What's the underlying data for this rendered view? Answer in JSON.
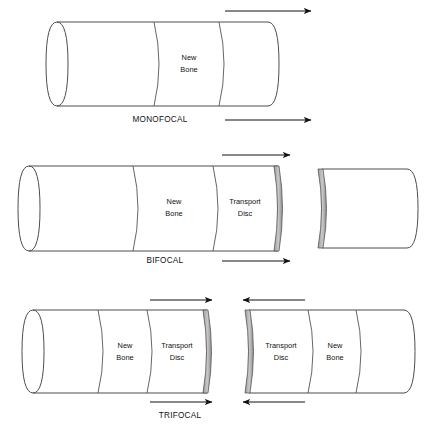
{
  "figure": {
    "title_visible": false,
    "background_color": "#ffffff",
    "outline_color": "#4d4d4d",
    "arrow_color": "#111111",
    "text_color": "#111111"
  },
  "labels": {
    "new_bone": "New\nBone",
    "new_bone_line1": "New",
    "new_bone_line2": "Bone",
    "transport_disc_line1": "Transport",
    "transport_disc_line2": "Disc"
  },
  "panels": [
    {
      "id": "monofocal",
      "caption": "MONOFOCAL",
      "segments": [
        {
          "name": "host-bone-proximal",
          "label": ""
        },
        {
          "name": "regenerate",
          "label_line1": "New",
          "label_line2": "Bone"
        },
        {
          "name": "host-bone-distal",
          "label": ""
        }
      ],
      "arrows": [
        {
          "name": "top-arrow",
          "direction": "right"
        },
        {
          "name": "bottom-arrow",
          "direction": "right"
        }
      ],
      "fragment_count": 1
    },
    {
      "id": "bifocal",
      "caption": "BIFOCAL",
      "segments": [
        {
          "name": "host-bone-proximal",
          "label": ""
        },
        {
          "name": "regenerate",
          "label_line1": "New",
          "label_line2": "Bone"
        },
        {
          "name": "transport-disc",
          "label_line1": "Transport",
          "label_line2": "Disc"
        },
        {
          "name": "distal-fragment",
          "label": ""
        }
      ],
      "arrows": [
        {
          "name": "top-arrow",
          "direction": "right"
        },
        {
          "name": "bottom-arrow",
          "direction": "right"
        }
      ],
      "fragment_count": 2
    },
    {
      "id": "trifocal",
      "caption": "TRIFOCAL",
      "segments": [
        {
          "name": "host-bone-proximal",
          "label": ""
        },
        {
          "name": "regenerate-left",
          "label_line1": "New",
          "label_line2": "Bone"
        },
        {
          "name": "transport-disc-left",
          "label_line1": "Transport",
          "label_line2": "Disc"
        },
        {
          "name": "transport-disc-right",
          "label_line1": "Transport",
          "label_line2": "Disc"
        },
        {
          "name": "regenerate-right",
          "label_line1": "New",
          "label_line2": "Bone"
        },
        {
          "name": "host-bone-distal",
          "label": ""
        }
      ],
      "arrows": [
        {
          "name": "top-left-arrow",
          "direction": "right"
        },
        {
          "name": "top-right-arrow",
          "direction": "left"
        },
        {
          "name": "bottom-left-arrow",
          "direction": "right"
        },
        {
          "name": "bottom-right-arrow",
          "direction": "left"
        }
      ],
      "fragment_count": 2
    }
  ]
}
